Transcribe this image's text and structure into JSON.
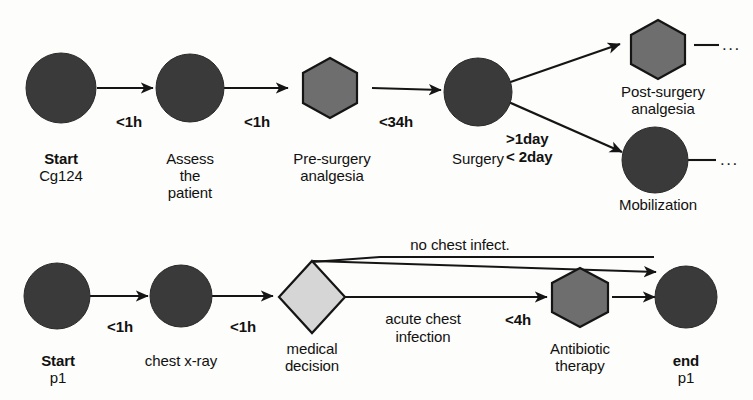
{
  "diagram": {
    "colors": {
      "dark_node": "#3a3a3a",
      "hexagon_fill": "#6e6e6e",
      "diamond_fill": "#d6d6d6",
      "stroke": "#151515",
      "background": "#fdfdfb",
      "text": "#111111"
    },
    "lanes": [
      {
        "id": "lane-cg124",
        "name": "Cg124 surgical pathway",
        "nodes": [
          {
            "id": "start-cg124",
            "shape": "circle",
            "label_bold": "Start",
            "label_sub": "Cg124",
            "fill": "dark_node"
          },
          {
            "id": "assess-patient",
            "shape": "circle",
            "label_line1": "Assess",
            "label_line2": "the",
            "label_line3": "patient",
            "fill": "dark_node"
          },
          {
            "id": "pre-surgery-analgesia",
            "shape": "hexagon",
            "label_line1": "Pre-surgery",
            "label_line2": "analgesia",
            "fill": "hexagon_fill"
          },
          {
            "id": "surgery",
            "shape": "circle",
            "label_line1": "Surgery",
            "fill": "dark_node"
          },
          {
            "id": "post-surgery-analgesia",
            "shape": "hexagon",
            "label_line1": "Post-surgery",
            "label_line2": "analgesia",
            "fill": "hexagon_fill"
          },
          {
            "id": "mobilization",
            "shape": "circle",
            "label_line1": "Mobilization",
            "fill": "dark_node"
          }
        ],
        "edges": [
          {
            "id": "e1",
            "from": "start-cg124",
            "to": "assess-patient",
            "label": "<1h"
          },
          {
            "id": "e2",
            "from": "assess-patient",
            "to": "pre-surgery-analgesia",
            "label": "<1h"
          },
          {
            "id": "e3",
            "from": "pre-surgery-analgesia",
            "to": "surgery",
            "label": "<34h"
          },
          {
            "id": "e4",
            "from": "surgery",
            "to": "post-surgery-analgesia",
            "label": ""
          },
          {
            "id": "e5",
            "from": "surgery",
            "to": "mobilization",
            "label_line1": ">1day",
            "label_line2": "< 2day"
          },
          {
            "id": "e6",
            "from": "post-surgery-analgesia",
            "to": "continues",
            "label": ""
          },
          {
            "id": "e7",
            "from": "mobilization",
            "to": "continues",
            "label": ""
          }
        ],
        "continuations": [
          {
            "id": "cont-post-surgery",
            "glyph": "..."
          },
          {
            "id": "cont-mobilization",
            "glyph": "..."
          }
        ]
      },
      {
        "id": "lane-p1",
        "name": "p1 chest infection pathway",
        "nodes": [
          {
            "id": "start-p1",
            "shape": "circle",
            "label_bold": "Start",
            "label_sub": "p1",
            "fill": "dark_node"
          },
          {
            "id": "chest-xray",
            "shape": "circle",
            "label_line1": "chest x-ray",
            "fill": "dark_node"
          },
          {
            "id": "medical-decision",
            "shape": "diamond",
            "label_line1": "medical",
            "label_line2": "decision",
            "fill": "diamond_fill"
          },
          {
            "id": "antibiotic-therapy",
            "shape": "hexagon",
            "label_line1": "Antibiotic",
            "label_line2": "therapy",
            "fill": "hexagon_fill"
          },
          {
            "id": "end-p1",
            "shape": "circle",
            "label_bold": "end",
            "label_sub": "p1",
            "fill": "dark_node"
          }
        ],
        "edges": [
          {
            "id": "b1",
            "from": "start-p1",
            "to": "chest-xray",
            "label": "<1h"
          },
          {
            "id": "b2",
            "from": "chest-xray",
            "to": "medical-decision",
            "label": "<1h"
          },
          {
            "id": "b3",
            "from": "medical-decision",
            "to": "end-p1",
            "label": "no chest infect."
          },
          {
            "id": "b4",
            "from": "medical-decision",
            "to": "antibiotic-therapy",
            "label_line1": "acute chest",
            "label_line2": "infection",
            "label_time": "<4h"
          },
          {
            "id": "b5",
            "from": "antibiotic-therapy",
            "to": "end-p1",
            "label": ""
          }
        ]
      }
    ]
  }
}
